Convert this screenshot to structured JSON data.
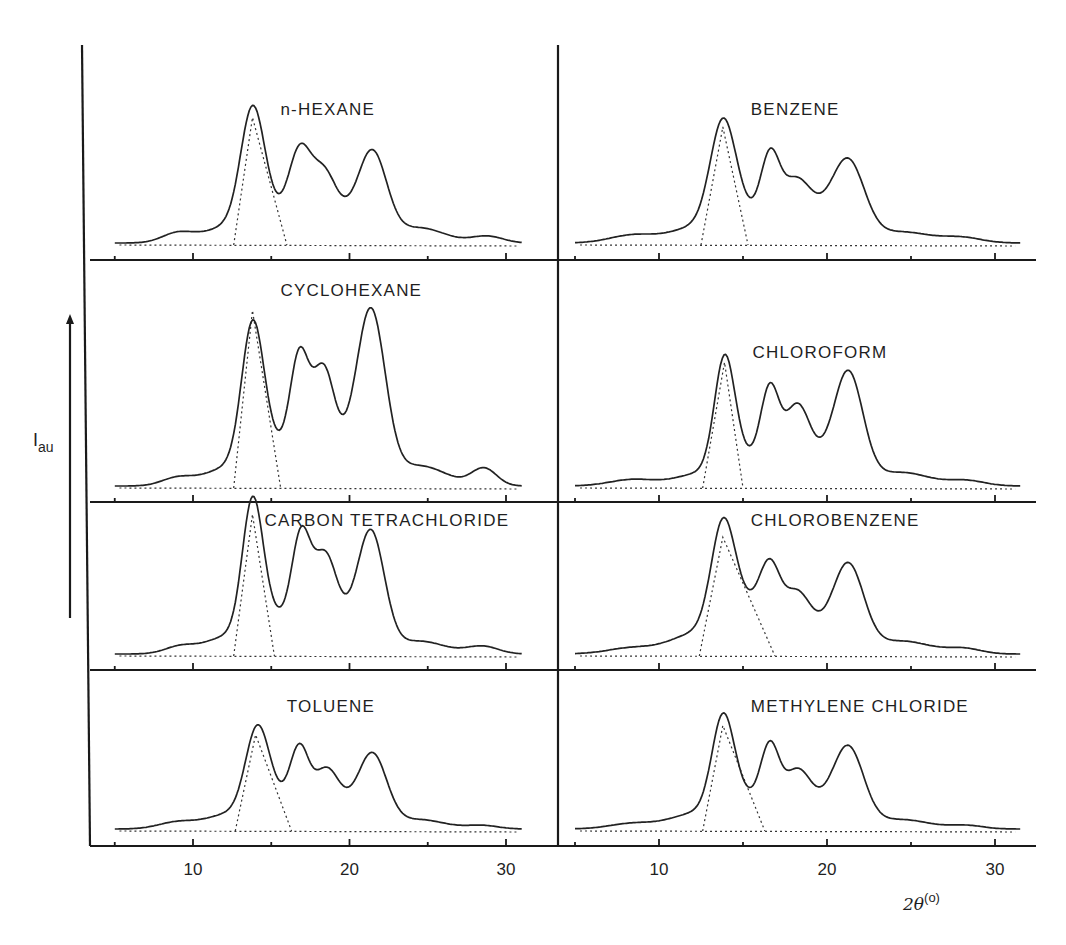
{
  "chart_data": {
    "type": "line",
    "title": "",
    "xlabel": "2θ",
    "xlabel_unit": "(o)",
    "ylabel": "I",
    "ylabel_sub": "au",
    "xlim": [
      4,
      32
    ],
    "x_ticks_major": [
      10,
      20,
      30
    ],
    "x_ticks_minor": [
      5,
      15,
      25
    ],
    "x_tick_labels": [
      "10",
      "20",
      "30"
    ],
    "grid": false,
    "layout": "4 rows x 2 columns",
    "panels": [
      {
        "name": "n-HEXANE",
        "column": "left",
        "row": 1,
        "main_peak_2theta": 13.8,
        "peaks": [
          {
            "x": 9.0,
            "height": 7,
            "width": 1.0
          },
          {
            "x": 13.8,
            "height": 80,
            "width": 0.75
          },
          {
            "x": 14.8,
            "height": 22,
            "width": 1.4
          },
          {
            "x": 16.8,
            "height": 55,
            "width": 0.7
          },
          {
            "x": 18.3,
            "height": 40,
            "width": 0.8
          },
          {
            "x": 21.5,
            "height": 57,
            "width": 0.9
          },
          {
            "x": 19.8,
            "height": 18,
            "width": 1.6
          },
          {
            "x": 24.5,
            "height": 11,
            "width": 1.6
          },
          {
            "x": 28.8,
            "height": 5,
            "width": 1.0
          },
          {
            "x": 12.0,
            "height": 10,
            "width": 1.5
          }
        ],
        "deconvolution_triangle": {
          "left_foot": 12.6,
          "apex": 13.8,
          "right_foot": 16.0,
          "apex_height": 93
        }
      },
      {
        "name": "BENZENE",
        "column": "right",
        "row": 1,
        "main_peak_2theta": 13.8,
        "peaks": [
          {
            "x": 8.5,
            "height": 6,
            "width": 1.4
          },
          {
            "x": 13.8,
            "height": 72,
            "width": 0.75
          },
          {
            "x": 14.9,
            "height": 22,
            "width": 1.4
          },
          {
            "x": 16.6,
            "height": 48,
            "width": 0.55
          },
          {
            "x": 18.1,
            "height": 36,
            "width": 0.9
          },
          {
            "x": 21.3,
            "height": 50,
            "width": 0.95
          },
          {
            "x": 19.8,
            "height": 18,
            "width": 1.6
          },
          {
            "x": 24.5,
            "height": 8,
            "width": 1.6
          },
          {
            "x": 28.0,
            "height": 4,
            "width": 1.2
          },
          {
            "x": 12.0,
            "height": 10,
            "width": 1.4
          }
        ],
        "deconvolution_triangle": {
          "left_foot": 12.5,
          "apex": 13.8,
          "right_foot": 15.3,
          "apex_height": 86
        }
      },
      {
        "name": "CYCLOHEXANE",
        "column": "left",
        "row": 2,
        "main_peak_2theta": 13.8,
        "peaks": [
          {
            "x": 9.0,
            "height": 6,
            "width": 1.0
          },
          {
            "x": 13.8,
            "height": 100,
            "width": 0.7
          },
          {
            "x": 15.0,
            "height": 30,
            "width": 1.3
          },
          {
            "x": 16.8,
            "height": 82,
            "width": 0.6
          },
          {
            "x": 18.3,
            "height": 72,
            "width": 0.7
          },
          {
            "x": 21.4,
            "height": 117,
            "width": 0.9
          },
          {
            "x": 19.8,
            "height": 25,
            "width": 1.5
          },
          {
            "x": 24.5,
            "height": 15,
            "width": 1.7
          },
          {
            "x": 28.6,
            "height": 13,
            "width": 0.8
          },
          {
            "x": 12.0,
            "height": 12,
            "width": 1.4
          }
        ],
        "deconvolution_triangle": {
          "left_foot": 12.6,
          "apex": 13.8,
          "right_foot": 15.6,
          "apex_height": 132
        }
      },
      {
        "name": "CHLOROFORM",
        "column": "right",
        "row": 2,
        "main_peak_2theta": 13.9,
        "peaks": [
          {
            "x": 8.5,
            "height": 5,
            "width": 1.4
          },
          {
            "x": 13.9,
            "height": 80,
            "width": 0.6
          },
          {
            "x": 14.9,
            "height": 22,
            "width": 1.2
          },
          {
            "x": 16.6,
            "height": 62,
            "width": 0.55
          },
          {
            "x": 18.2,
            "height": 50,
            "width": 0.75
          },
          {
            "x": 21.3,
            "height": 74,
            "width": 0.85
          },
          {
            "x": 19.8,
            "height": 18,
            "width": 1.6
          },
          {
            "x": 24.5,
            "height": 10,
            "width": 1.6
          },
          {
            "x": 28.3,
            "height": 4,
            "width": 1.1
          },
          {
            "x": 12.2,
            "height": 8,
            "width": 1.3
          }
        ],
        "deconvolution_triangle": {
          "left_foot": 12.6,
          "apex": 13.9,
          "right_foot": 15.0,
          "apex_height": 93
        }
      },
      {
        "name": "CARBON TETRACHLORIDE",
        "column": "left",
        "row": 3,
        "main_peak_2theta": 13.8,
        "peaks": [
          {
            "x": 9.2,
            "height": 6,
            "width": 1.0
          },
          {
            "x": 13.8,
            "height": 100,
            "width": 0.65
          },
          {
            "x": 15.0,
            "height": 30,
            "width": 1.3
          },
          {
            "x": 16.9,
            "height": 78,
            "width": 0.6
          },
          {
            "x": 18.4,
            "height": 63,
            "width": 0.75
          },
          {
            "x": 21.4,
            "height": 84,
            "width": 0.85
          },
          {
            "x": 19.8,
            "height": 22,
            "width": 1.5
          },
          {
            "x": 24.5,
            "height": 10,
            "width": 1.6
          },
          {
            "x": 28.5,
            "height": 6,
            "width": 1.0
          },
          {
            "x": 12.0,
            "height": 12,
            "width": 1.3
          }
        ],
        "deconvolution_triangle": {
          "left_foot": 12.6,
          "apex": 13.8,
          "right_foot": 15.2,
          "apex_height": 110
        }
      },
      {
        "name": "CHLOROBENZENE",
        "column": "right",
        "row": 3,
        "main_peak_2theta": 13.8,
        "peaks": [
          {
            "x": 8.5,
            "height": 5,
            "width": 1.5
          },
          {
            "x": 13.8,
            "height": 78,
            "width": 0.7
          },
          {
            "x": 15.2,
            "height": 38,
            "width": 1.4
          },
          {
            "x": 16.6,
            "height": 45,
            "width": 0.6
          },
          {
            "x": 18.2,
            "height": 36,
            "width": 0.8
          },
          {
            "x": 21.3,
            "height": 60,
            "width": 0.9
          },
          {
            "x": 19.8,
            "height": 16,
            "width": 1.6
          },
          {
            "x": 24.5,
            "height": 10,
            "width": 1.7
          },
          {
            "x": 28.2,
            "height": 4,
            "width": 1.0
          },
          {
            "x": 12.0,
            "height": 14,
            "width": 1.4
          }
        ],
        "deconvolution_triangle": {
          "left_foot": 12.4,
          "apex": 13.8,
          "right_foot": 16.9,
          "apex_height": 92
        }
      },
      {
        "name": "TOLUENE",
        "column": "left",
        "row": 4,
        "main_peak_2theta": 14.2,
        "peaks": [
          {
            "x": 9.0,
            "height": 6,
            "width": 1.2
          },
          {
            "x": 14.1,
            "height": 70,
            "width": 0.75
          },
          {
            "x": 15.3,
            "height": 24,
            "width": 1.3
          },
          {
            "x": 16.8,
            "height": 55,
            "width": 0.6
          },
          {
            "x": 18.5,
            "height": 40,
            "width": 0.8
          },
          {
            "x": 21.5,
            "height": 56,
            "width": 0.9
          },
          {
            "x": 19.8,
            "height": 16,
            "width": 1.6
          },
          {
            "x": 24.5,
            "height": 8,
            "width": 1.6
          },
          {
            "x": 28.5,
            "height": 3,
            "width": 1.0
          },
          {
            "x": 12.2,
            "height": 12,
            "width": 1.4
          }
        ],
        "deconvolution_triangle": {
          "left_foot": 12.7,
          "apex": 14.0,
          "right_foot": 16.3,
          "apex_height": 82
        }
      },
      {
        "name": "METHYLENE CHLORIDE",
        "column": "right",
        "row": 4,
        "main_peak_2theta": 13.8,
        "peaks": [
          {
            "x": 8.5,
            "height": 5,
            "width": 1.4
          },
          {
            "x": 13.8,
            "height": 76,
            "width": 0.65
          },
          {
            "x": 14.9,
            "height": 28,
            "width": 1.3
          },
          {
            "x": 16.6,
            "height": 57,
            "width": 0.55
          },
          {
            "x": 18.2,
            "height": 40,
            "width": 0.8
          },
          {
            "x": 21.3,
            "height": 60,
            "width": 0.9
          },
          {
            "x": 19.8,
            "height": 18,
            "width": 1.6
          },
          {
            "x": 24.5,
            "height": 8,
            "width": 1.6
          },
          {
            "x": 28.3,
            "height": 3,
            "width": 1.0
          },
          {
            "x": 12.0,
            "height": 12,
            "width": 1.4
          }
        ],
        "deconvolution_triangle": {
          "left_foot": 12.6,
          "apex": 13.8,
          "right_foot": 16.3,
          "apex_height": 90
        }
      }
    ]
  },
  "labels": {
    "ylabel_main": "I",
    "ylabel_sub": "au",
    "xlabel_main": "2θ",
    "xlabel_sup": "(o)"
  }
}
